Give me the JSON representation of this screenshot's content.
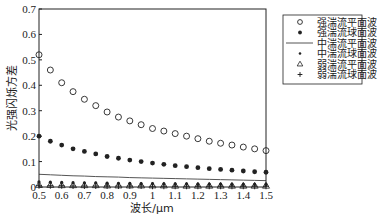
{
  "chart_data": {
    "type": "line",
    "title": "",
    "xlabel": "波长/μm",
    "ylabel": "光强闪烁方差",
    "xlim": [
      0.5,
      1.5
    ],
    "ylim": [
      0,
      0.7
    ],
    "xticks": [
      0.5,
      0.6,
      0.7,
      0.8,
      0.9,
      1,
      1.1,
      1.2,
      1.3,
      1.4,
      1.5
    ],
    "xtick_labels": [
      "0.5",
      "0.6",
      "0.7",
      "0.8",
      "0.9",
      "1",
      "1.1",
      "1.2",
      "1.3",
      "1.4",
      "1.5"
    ],
    "yticks": [
      0,
      0.1,
      0.2,
      0.3,
      0.4,
      0.5,
      0.6,
      0.7
    ],
    "ytick_labels": [
      "0",
      "0.1",
      "0.2",
      "0.3",
      "0.4",
      "0.5",
      "0.6",
      "0.7"
    ],
    "grid": false,
    "legend_position": "outside-right-top",
    "x": [
      0.5,
      0.55,
      0.6,
      0.65,
      0.7,
      0.75,
      0.8,
      0.85,
      0.9,
      0.95,
      1.0,
      1.05,
      1.1,
      1.15,
      1.2,
      1.25,
      1.3,
      1.35,
      1.4,
      1.45,
      1.5
    ],
    "series": [
      {
        "name": "强湍流平面波",
        "marker": "circle-open",
        "line": false,
        "values": [
          0.52,
          0.46,
          0.41,
          0.375,
          0.345,
          0.32,
          0.295,
          0.275,
          0.26,
          0.245,
          0.23,
          0.22,
          0.21,
          0.2,
          0.19,
          0.18,
          0.172,
          0.165,
          0.157,
          0.15,
          0.143
        ]
      },
      {
        "name": "强湍流球面波",
        "marker": "diamond-filled",
        "line": false,
        "values": [
          0.2,
          0.18,
          0.165,
          0.15,
          0.14,
          0.13,
          0.12,
          0.113,
          0.106,
          0.1,
          0.094,
          0.089,
          0.084,
          0.08,
          0.076,
          0.072,
          0.069,
          0.066,
          0.063,
          0.06,
          0.058
        ]
      },
      {
        "name": "中湍流平面波",
        "marker": "none",
        "line": true,
        "values": [
          0.05,
          0.048,
          0.046,
          0.044,
          0.043,
          0.041,
          0.04,
          0.039,
          0.037,
          0.036,
          0.035,
          0.034,
          0.033,
          0.032,
          0.031,
          0.03,
          0.029,
          0.028,
          0.027,
          0.026,
          0.025
        ]
      },
      {
        "name": "中湍流球面波",
        "marker": "dot",
        "line": false,
        "values": [
          0.02,
          0.019,
          0.018,
          0.017,
          0.016,
          0.016,
          0.015,
          0.014,
          0.014,
          0.013,
          0.013,
          0.012,
          0.012,
          0.012,
          0.011,
          0.011,
          0.011,
          0.01,
          0.01,
          0.01,
          0.01
        ]
      },
      {
        "name": "弱湍流平面波",
        "marker": "triangle-open",
        "line": false,
        "values": [
          0.008,
          0.008,
          0.007,
          0.007,
          0.007,
          0.007,
          0.006,
          0.006,
          0.006,
          0.006,
          0.006,
          0.006,
          0.005,
          0.005,
          0.005,
          0.005,
          0.005,
          0.005,
          0.005,
          0.005,
          0.005
        ]
      },
      {
        "name": "弱湍流球面波",
        "marker": "plus",
        "line": false,
        "values": [
          0.005,
          0.005,
          0.005,
          0.004,
          0.004,
          0.004,
          0.004,
          0.004,
          0.004,
          0.004,
          0.003,
          0.003,
          0.003,
          0.003,
          0.003,
          0.003,
          0.003,
          0.003,
          0.003,
          0.003,
          0.003
        ]
      }
    ]
  },
  "colors": {
    "axis": "#222222",
    "series": "#222222",
    "line": "#555555",
    "background": "#ffffff"
  }
}
